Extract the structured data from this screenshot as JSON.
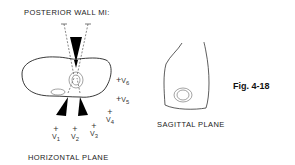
{
  "figure": {
    "title": "POSTERIOR WALL MI:",
    "label": "Fig. 4-18",
    "accent_color": "#000000"
  },
  "horizontal_plane": {
    "caption": "HORIZONTAL PLANE",
    "leads": [
      {
        "name": "V1",
        "base": "V",
        "sub": "1"
      },
      {
        "name": "V2",
        "base": "V",
        "sub": "2"
      },
      {
        "name": "V3",
        "base": "V",
        "sub": "3"
      },
      {
        "name": "V4",
        "base": "V",
        "sub": "4"
      },
      {
        "name": "V5",
        "base": "V",
        "sub": "5"
      },
      {
        "name": "V6",
        "base": "V",
        "sub": "6"
      }
    ],
    "plus_symbol": "+"
  },
  "sagittal_plane": {
    "caption": "SAGITTAL PLANE"
  }
}
